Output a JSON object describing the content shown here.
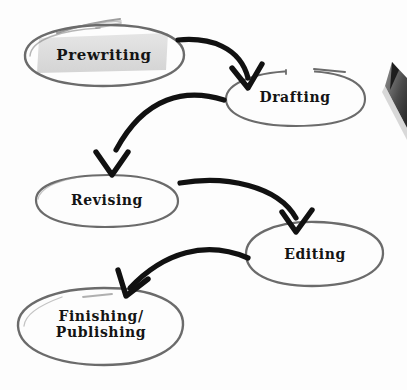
{
  "diagram": {
    "type": "flowchart",
    "style": "hand-drawn",
    "background_color": "#fdfdfd",
    "node_stroke_color": "#6b6b6b",
    "arrow_color": "#111111",
    "text_color": "#141414",
    "highlight_color": "#dcdcdc",
    "nodes": [
      {
        "id": "prewriting",
        "label": "Prewriting",
        "shape": "ellipse",
        "order": 1,
        "cx": 104,
        "cy": 55,
        "rx": 80,
        "ry": 30,
        "font_size": 15,
        "highlighted": true
      },
      {
        "id": "drafting",
        "label": "Drafting",
        "shape": "ellipse",
        "order": 2,
        "cx": 295,
        "cy": 98,
        "rx": 70,
        "ry": 28,
        "font_size": 14,
        "highlighted": false
      },
      {
        "id": "revising",
        "label": "Revising",
        "shape": "ellipse",
        "order": 3,
        "cx": 106,
        "cy": 200,
        "rx": 72,
        "ry": 26,
        "font_size": 14,
        "highlighted": false
      },
      {
        "id": "editing",
        "label": "Editing",
        "shape": "ellipse",
        "order": 4,
        "cx": 314,
        "cy": 254,
        "rx": 70,
        "ry": 32,
        "font_size": 14,
        "highlighted": false
      },
      {
        "id": "finishing-publishing",
        "label": "Finishing/\nPublishing",
        "shape": "blob",
        "order": 5,
        "cx": 101,
        "cy": 326,
        "rx": 83,
        "ry": 39,
        "font_size": 14,
        "highlighted": false
      }
    ],
    "edges": [
      {
        "id": "edge-prewriting-drafting",
        "from": "prewriting",
        "to": "drafting",
        "direction": "right-down"
      },
      {
        "id": "edge-drafting-revising",
        "from": "drafting",
        "to": "revising",
        "direction": "left-down"
      },
      {
        "id": "edge-revising-editing",
        "from": "revising",
        "to": "editing",
        "direction": "right-down"
      },
      {
        "id": "edge-editing-finishing",
        "from": "editing",
        "to": "finishing-publishing",
        "direction": "left-down"
      }
    ],
    "decorations": [
      {
        "id": "pencil-tip",
        "label": "pencil-tip",
        "description": "partially visible pencil tip at right edge"
      },
      {
        "id": "stray-marks",
        "label": "stray-pencil-marks",
        "description": "faint gray stray lines above first node"
      }
    ]
  }
}
